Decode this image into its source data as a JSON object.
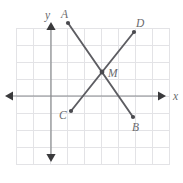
{
  "figure": {
    "background_color": "#ffffff",
    "width": 183,
    "height": 183
  },
  "colors": {
    "grid": "#e3e3e6",
    "axis": "#888a8d",
    "arrow": "#3a3a3c",
    "segment": "#5d5d62",
    "point": "#4a4a4f",
    "label_text": "#6a6a6e"
  },
  "axes": {
    "x_axis": {
      "label": "x",
      "label_x": 173,
      "label_y": 100,
      "y_position": 96,
      "x_start": 5,
      "x_end": 166,
      "left_arrow": true,
      "right_arrow": true
    },
    "y_axis": {
      "label": "y",
      "label_x": 45,
      "label_y": 19,
      "x_position": 51,
      "y_start": 22,
      "y_end": 162,
      "up_arrow": true,
      "down_arrow": true
    }
  },
  "grid": {
    "visible": true,
    "spacing": 17.1,
    "x_min": 16,
    "x_max": 170,
    "y_min": 28,
    "y_max": 165,
    "x_lines": [
      16.0,
      33.1,
      50.2,
      67.3,
      84.4,
      101.5,
      118.6,
      135.7,
      152.8,
      169.9
    ],
    "y_lines": [
      28.0,
      45.1,
      62.2,
      79.3,
      96.4,
      113.5,
      130.6,
      147.7,
      164.8
    ]
  },
  "segments": [
    {
      "name": "AB",
      "from_point": "A",
      "to_point": "B",
      "x1": 68,
      "y1": 23,
      "x2": 133,
      "y2": 117
    },
    {
      "name": "CD",
      "from_point": "C",
      "to_point": "D",
      "x1": 71,
      "y1": 111,
      "x2": 134,
      "y2": 32
    }
  ],
  "points": [
    {
      "label": "A",
      "x": 68,
      "y": 23,
      "label_x": 61,
      "label_y": 18,
      "radius": 2.1
    },
    {
      "label": "B",
      "x": 133,
      "y": 117,
      "label_x": 132,
      "label_y": 131,
      "radius": 2.1
    },
    {
      "label": "C",
      "x": 71,
      "y": 111,
      "label_x": 59,
      "label_y": 119,
      "radius": 2.1
    },
    {
      "label": "D",
      "x": 134,
      "y": 32,
      "label_x": 136,
      "label_y": 27,
      "radius": 2.1
    },
    {
      "label": "M",
      "x": 102,
      "y": 72,
      "label_x": 108,
      "label_y": 77,
      "radius": 2.4
    }
  ],
  "chart_data": {
    "type": "scatter",
    "title": "",
    "xlabel": "x",
    "ylabel": "y",
    "grid": true,
    "legend_position": "none",
    "origin_pixel": {
      "x": 51,
      "y": 96
    },
    "pixels_per_unit": 17.1,
    "points": [
      {
        "label": "A",
        "x": 1,
        "y": 4.25
      },
      {
        "label": "B",
        "x": 4.8,
        "y": -1.25
      },
      {
        "label": "C",
        "x": 1.15,
        "y": -0.9
      },
      {
        "label": "D",
        "x": 4.85,
        "y": 3.75
      },
      {
        "label": "M",
        "x": 3,
        "y": 1.4
      }
    ],
    "series": [
      {
        "name": "AB",
        "endpoints": [
          "A",
          "B"
        ]
      },
      {
        "name": "CD",
        "endpoints": [
          "C",
          "D"
        ]
      }
    ],
    "annotations": [
      "A",
      "B",
      "C",
      "D",
      "M",
      "x",
      "y"
    ]
  }
}
